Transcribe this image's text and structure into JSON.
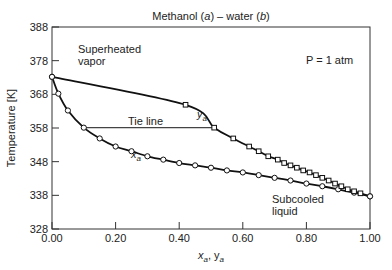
{
  "chart_data": {
    "type": "line",
    "title": "Methanol (a) – water (b)",
    "title_parts": {
      "pre": "Methanol (",
      "a": "a",
      "mid": ") – water (",
      "b": "b",
      "post": ")"
    },
    "xlabel": "x_a, y_a",
    "ylabel": "Temperature [K]",
    "xlim": [
      0.0,
      1.0
    ],
    "ylim": [
      328,
      388
    ],
    "xticks": [
      "0.00",
      "0.20",
      "0.40",
      "0.60",
      "0.80",
      "1.00"
    ],
    "yticks": [
      "328",
      "338",
      "348",
      "358",
      "368",
      "378",
      "388"
    ],
    "grid": false,
    "annotations": {
      "pressure": "P = 1 atm",
      "superheated_1": "Superheated",
      "superheated_2": "vapor",
      "subcooled_1": "Subcooled",
      "subcooled_2": "liquid",
      "tie_line": "Tie line",
      "ya_label": "y",
      "xa_label": "x",
      "sub": "a"
    },
    "tie_line": {
      "T": 358.1,
      "x_start": 0.1,
      "x_end": 0.51
    },
    "series": [
      {
        "name": "x_a (bubble point, liquid)",
        "marker": "circle",
        "x": [
          0.0,
          0.02,
          0.05,
          0.1,
          0.15,
          0.2,
          0.25,
          0.3,
          0.35,
          0.4,
          0.45,
          0.5,
          0.55,
          0.6,
          0.65,
          0.7,
          0.75,
          0.8,
          0.85,
          0.9,
          0.95,
          1.0
        ],
        "T": [
          373.2,
          368.2,
          363.2,
          358.1,
          354.9,
          352.5,
          351.1,
          349.6,
          348.6,
          347.6,
          346.9,
          346.2,
          345.4,
          344.8,
          344.0,
          343.2,
          342.4,
          341.5,
          340.7,
          339.8,
          338.8,
          337.7
        ]
      },
      {
        "name": "y_a (dew point, vapor)",
        "marker": "square",
        "x": [
          0.0,
          0.42,
          0.51,
          0.57,
          0.62,
          0.65,
          0.68,
          0.71,
          0.73,
          0.75,
          0.77,
          0.79,
          0.81,
          0.83,
          0.85,
          0.87,
          0.89,
          0.91,
          0.93,
          0.95,
          0.97,
          1.0
        ],
        "T": [
          373.2,
          364.9,
          358.1,
          354.9,
          352.5,
          351.1,
          349.6,
          348.6,
          347.6,
          346.9,
          346.2,
          345.4,
          344.8,
          344.0,
          343.2,
          342.4,
          341.5,
          340.7,
          339.8,
          339.2,
          338.6,
          337.7
        ]
      }
    ]
  }
}
